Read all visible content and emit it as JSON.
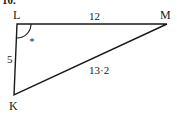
{
  "question_number": "10.",
  "figure": {
    "type": "triangle",
    "vertices": [
      {
        "name": "L",
        "x": 17,
        "y": 24
      },
      {
        "name": "M",
        "x": 167,
        "y": 24
      },
      {
        "name": "K",
        "x": 14,
        "y": 95
      }
    ],
    "sides": [
      {
        "between": "LM",
        "label": "12"
      },
      {
        "between": "LK",
        "label": "5"
      },
      {
        "between": "KM",
        "label": "13·2"
      }
    ],
    "marked_angle": {
      "vertex": "L",
      "marker": "*"
    },
    "stroke_color": "#1a1a1a"
  },
  "labels": {
    "L": "L",
    "M": "M",
    "K": "K",
    "side_LM": "12",
    "side_LK": "5",
    "side_KM": "13·2",
    "angle_marker": "*"
  }
}
